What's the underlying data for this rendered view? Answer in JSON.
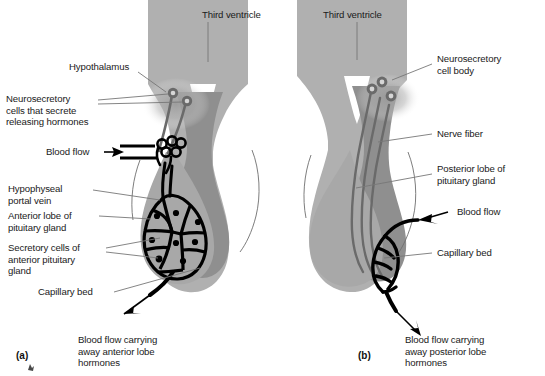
{
  "figure": {
    "background_color": "#ffffff",
    "text_color": "#1a1a1a",
    "tissue_light_color": "#b0b0b0",
    "tissue_dark_color": "#8f8f8f",
    "vessel_color": "#000000",
    "leader_line_color": "#555555"
  },
  "panels": [
    {
      "id": "a",
      "id_label": "(a)",
      "labels": [
        {
          "key": "third_ventricle",
          "text": "Third ventricle"
        },
        {
          "key": "hypothalamus",
          "text": "Hypothalamus"
        },
        {
          "key": "neurosecretory",
          "text": "Neurosecretory\ncells that secrete\nreleasing hormones"
        },
        {
          "key": "blood_flow",
          "text": "Blood flow"
        },
        {
          "key": "portal_vein",
          "text": "Hypophyseal\nportal vein"
        },
        {
          "key": "anterior_lobe",
          "text": "Anterior lobe of\npituitary gland"
        },
        {
          "key": "secretory_cells",
          "text": "Secretory cells of\nanterior pituitary\ngland"
        },
        {
          "key": "capillary_bed",
          "text": "Capillary bed"
        },
        {
          "key": "outflow",
          "text": "Blood flow carrying\naway anterior lobe\nhormones"
        }
      ]
    },
    {
      "id": "b",
      "id_label": "(b)",
      "labels": [
        {
          "key": "third_ventricle",
          "text": "Third ventricle"
        },
        {
          "key": "cell_body",
          "text": "Neurosecretory\ncell body"
        },
        {
          "key": "nerve_fiber",
          "text": "Nerve fiber"
        },
        {
          "key": "posterior_lobe",
          "text": "Posterior lobe of\npituitary gland"
        },
        {
          "key": "blood_flow",
          "text": "Blood flow"
        },
        {
          "key": "capillary_bed",
          "text": "Capillary bed"
        },
        {
          "key": "outflow",
          "text": "Blood flow carrying\naway posterior lobe\nhormones"
        }
      ]
    }
  ]
}
